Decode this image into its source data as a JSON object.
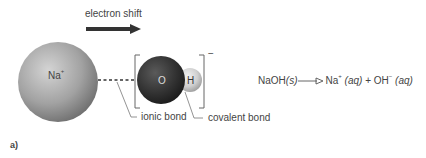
{
  "diagram": {
    "arrow_label": "electron shift",
    "atoms": {
      "na": {
        "symbol": "Na",
        "charge": "+"
      },
      "o": {
        "symbol": "O"
      },
      "h": {
        "symbol": "H"
      }
    },
    "ion_charge": "−",
    "labels": {
      "ionic_bond": "ionic bond",
      "covalent_bond": "covalent bond"
    },
    "equation": {
      "reactant": "NaOH",
      "reactant_state": "(s)",
      "product1": "Na",
      "product1_charge": "+",
      "product1_state": "(aq)",
      "plus": "+",
      "product2": "OH",
      "product2_charge": "−",
      "product2_state": "(aq)"
    },
    "panel_label": "a)"
  }
}
